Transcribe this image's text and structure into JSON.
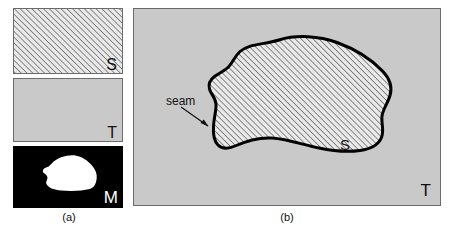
{
  "figure": {
    "background_color": "#ffffff"
  },
  "panel_a": {
    "caption": "(a)",
    "thumbnails": [
      {
        "id": "source",
        "label": "S",
        "fill": "hatched",
        "fill_color": "#e3e3e3",
        "hatch_color": "#3a3a3a",
        "border_color": "#6b6b6b",
        "label_color": "#111111"
      },
      {
        "id": "target",
        "label": "T",
        "fill": "solid",
        "fill_color": "#c9c9c9",
        "border_color": "#6b6b6b",
        "label_color": "#111111"
      },
      {
        "id": "mask",
        "label": "M",
        "fill": "binary-mask",
        "fill_color": "#000000",
        "mask_shape_color": "#ffffff",
        "border_color": "#000000",
        "label_color": "#ffffff"
      }
    ]
  },
  "panel_b": {
    "caption": "(b)",
    "background_color": "#c9c9c9",
    "target_label": "T",
    "source_label": "S",
    "seam_label": "seam",
    "blob_fill_color": "#e3e3e3",
    "blob_hatch_color": "#3a3a3a",
    "blob_outline_color": "#000000",
    "blob_outline_width": 3,
    "arrow_color": "#111111"
  }
}
